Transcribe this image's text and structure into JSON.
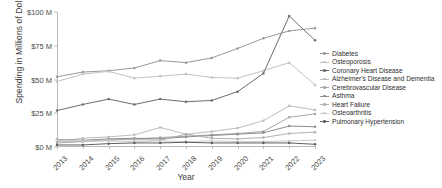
{
  "chart_data": {
    "type": "line",
    "title": "",
    "xlabel": "Year",
    "ylabel": "Spending in Millions of Dollars",
    "x": [
      2013,
      2014,
      2015,
      2016,
      2017,
      2018,
      2019,
      2020,
      2021,
      2022,
      2023
    ],
    "xtick_labels": [
      "2013",
      "2014",
      "2015",
      "2016",
      "2017",
      "2018",
      "2019",
      "2020",
      "2021",
      "2022",
      "2023"
    ],
    "ylim": [
      0,
      100
    ],
    "yticks": [
      0,
      25,
      50,
      75,
      100
    ],
    "ytick_labels": [
      "$0 M",
      "$25 M",
      "$50 M",
      "$75 M",
      "$100 M"
    ],
    "grid": false,
    "legend_position": "right",
    "series": [
      {
        "name": "Diabetes",
        "color": "#9a9a9a",
        "values": [
          52.0,
          55.5,
          56.5,
          58.5,
          64.0,
          62.5,
          66.0,
          73.0,
          80.5,
          86.0,
          88.0
        ]
      },
      {
        "name": "Osteoporosis",
        "color": "#c2c2c2",
        "values": [
          48.5,
          54.0,
          56.0,
          51.0,
          52.5,
          54.0,
          51.5,
          51.0,
          56.5,
          62.5,
          46.0
        ]
      },
      {
        "name": "Coronary Heart Disease",
        "color": "#6e6e6e",
        "values": [
          27.0,
          31.5,
          35.5,
          31.5,
          35.5,
          33.5,
          34.5,
          41.0,
          54.5,
          97.0,
          79.0
        ]
      },
      {
        "name": "Alzheimer's Disease and Dementia",
        "color": "#bdbdbd",
        "values": [
          4.0,
          6.5,
          7.5,
          9.0,
          14.5,
          9.5,
          11.5,
          14.0,
          19.5,
          30.5,
          27.5
        ]
      },
      {
        "name": "Cerebrovascular Disease",
        "color": "#a8a8a8",
        "values": [
          3.0,
          4.0,
          5.0,
          6.0,
          7.0,
          8.0,
          9.0,
          10.0,
          11.5,
          22.0,
          24.5
        ]
      },
      {
        "name": "Asthma",
        "color": "#8f8f8f",
        "values": [
          5.5,
          5.0,
          6.0,
          6.5,
          6.0,
          7.5,
          8.5,
          9.5,
          10.5,
          15.5,
          15.0
        ]
      },
      {
        "name": "Heart Failure",
        "color": "#b0b0b0",
        "values": [
          4.5,
          4.0,
          5.5,
          5.5,
          5.0,
          9.5,
          6.5,
          6.0,
          7.0,
          10.0,
          11.0
        ]
      },
      {
        "name": "Osteoarthritis",
        "color": "#cccccc",
        "values": [
          5.0,
          4.5,
          4.5,
          4.0,
          4.5,
          4.0,
          4.5,
          4.0,
          4.0,
          4.5,
          5.0
        ]
      },
      {
        "name": "Pulmonary Hypertension",
        "color": "#5f5f5f",
        "values": [
          1.5,
          1.5,
          2.5,
          3.0,
          3.0,
          3.5,
          3.0,
          3.0,
          3.0,
          3.0,
          2.0
        ]
      }
    ]
  }
}
